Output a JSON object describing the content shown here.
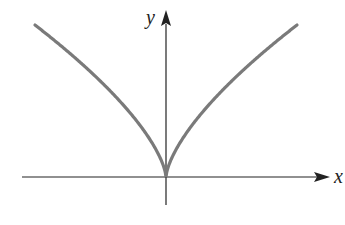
{
  "chart_data": {
    "type": "line",
    "title": "",
    "function": "y = |x|^(2/3)",
    "xlabel": "x",
    "ylabel": "y",
    "xlim": [
      -1,
      1
    ],
    "ylim": [
      0,
      1
    ],
    "grid": false,
    "legend": null,
    "series": [
      {
        "name": "y = x^(2/3)",
        "x": [
          -1,
          -0.75,
          -0.5,
          -0.25,
          -0.1,
          0,
          0.1,
          0.25,
          0.5,
          0.75,
          1
        ],
        "y": [
          1,
          0.825,
          0.63,
          0.397,
          0.215,
          0,
          0.215,
          0.397,
          0.63,
          0.825,
          1
        ]
      }
    ],
    "annotations": [
      "cusp at origin"
    ]
  },
  "colors": {
    "curve": "#7a7a7a",
    "axes": "#222222",
    "background": "#ffffff"
  },
  "labels": {
    "x_axis": "x",
    "y_axis": "y"
  }
}
